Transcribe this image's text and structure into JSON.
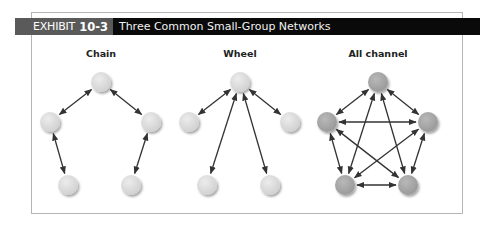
{
  "exhibit": {
    "label": "EXHIBIT",
    "number": "10-3",
    "title": "Three Common Small-Group Networks"
  },
  "networks": [
    {
      "id": "chain",
      "label": "Chain",
      "node_color": "#d9d9d9",
      "nodes": [
        "top",
        "left",
        "right",
        "bottom-left",
        "bottom-right"
      ],
      "edges": [
        [
          "top",
          "left"
        ],
        [
          "top",
          "right"
        ],
        [
          "left",
          "bottom-left"
        ],
        [
          "right",
          "bottom-right"
        ]
      ]
    },
    {
      "id": "wheel",
      "label": "Wheel",
      "node_color": "#d9d9d9",
      "nodes": [
        "top",
        "left",
        "right",
        "bottom-left",
        "bottom-right"
      ],
      "edges": [
        [
          "top",
          "left"
        ],
        [
          "top",
          "right"
        ],
        [
          "top",
          "bottom-left"
        ],
        [
          "top",
          "bottom-right"
        ]
      ]
    },
    {
      "id": "all-channel",
      "label": "All channel",
      "node_color": "#a8a8a8",
      "nodes": [
        "top",
        "left",
        "right",
        "bottom-left",
        "bottom-right"
      ],
      "edges": [
        [
          "top",
          "left"
        ],
        [
          "top",
          "right"
        ],
        [
          "top",
          "bottom-left"
        ],
        [
          "top",
          "bottom-right"
        ],
        [
          "left",
          "right"
        ],
        [
          "left",
          "bottom-left"
        ],
        [
          "left",
          "bottom-right"
        ],
        [
          "right",
          "bottom-left"
        ],
        [
          "right",
          "bottom-right"
        ],
        [
          "bottom-left",
          "bottom-right"
        ]
      ]
    }
  ],
  "edge_style": "bidirectional-arrow"
}
